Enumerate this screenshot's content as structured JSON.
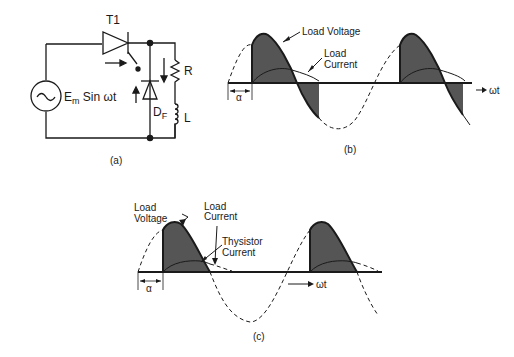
{
  "panel_a": {
    "caption": "(a)",
    "thyristor_label": "T1",
    "source_label_main": "E",
    "source_label_sub": "m",
    "source_label_rest": " Sin ωt",
    "diode_label_main": "D",
    "diode_label_sub": "F",
    "resistor_label": "R",
    "inductor_label": "L"
  },
  "panel_b": {
    "caption": "(b)",
    "load_voltage_label": "Load Voltage",
    "load_current_label_1": "Load",
    "load_current_label_2": "Current",
    "alpha_label": "α",
    "axis_label": "ωt"
  },
  "panel_c": {
    "caption": "(c)",
    "load_voltage_label_1": "Load",
    "load_voltage_label_2": "Voltage",
    "load_current_label_1": "Load",
    "load_current_label_2": "Current",
    "thyristor_current_label_1": "Thysistor",
    "thyristor_current_label_2": "Current",
    "alpha_label": "α",
    "axis_label": "ωt"
  },
  "colors": {
    "ink": "#1a1a1a",
    "shade": "#555555"
  }
}
